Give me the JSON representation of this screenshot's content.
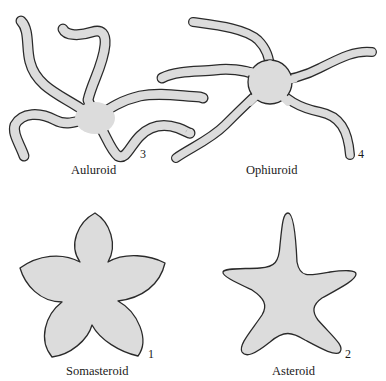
{
  "figure": {
    "panels": [
      {
        "id": "auluroid",
        "label": "Auluroid",
        "number": "3"
      },
      {
        "id": "ophiuroid",
        "label": "Ophiuroid",
        "number": "4"
      },
      {
        "id": "somasteroid",
        "label": "Somasteroid",
        "number": "1"
      },
      {
        "id": "asteroid",
        "label": "Asteroid",
        "number": "2"
      }
    ],
    "colors": {
      "fill": "#dcdcdc",
      "outline": "#2a2a2a",
      "background": "#ffffff"
    }
  }
}
